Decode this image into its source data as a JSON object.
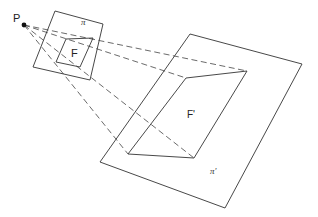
{
  "diagram": {
    "type": "projective-geometry",
    "point": {
      "label": "P",
      "x": 24,
      "y": 25
    },
    "plane_small": {
      "label": "π",
      "corners": [
        [
          55,
          11
        ],
        [
          103,
          24
        ],
        [
          90,
          80
        ],
        [
          33,
          67
        ]
      ]
    },
    "figure_small": {
      "label": "F",
      "corners": [
        [
          66,
          39
        ],
        [
          93,
          38
        ],
        [
          80,
          67
        ],
        [
          56,
          62
        ]
      ]
    },
    "plane_large": {
      "label": "π'",
      "corners": [
        [
          190,
          34
        ],
        [
          302,
          64
        ],
        [
          225,
          208
        ],
        [
          100,
          162
        ]
      ]
    },
    "figure_large": {
      "label": "F'",
      "corners": [
        [
          186,
          78
        ],
        [
          247,
          71
        ],
        [
          194,
          158
        ],
        [
          128,
          154
        ]
      ]
    },
    "colors": {
      "line": "#333333",
      "point": "#111111",
      "background": "#ffffff"
    }
  }
}
